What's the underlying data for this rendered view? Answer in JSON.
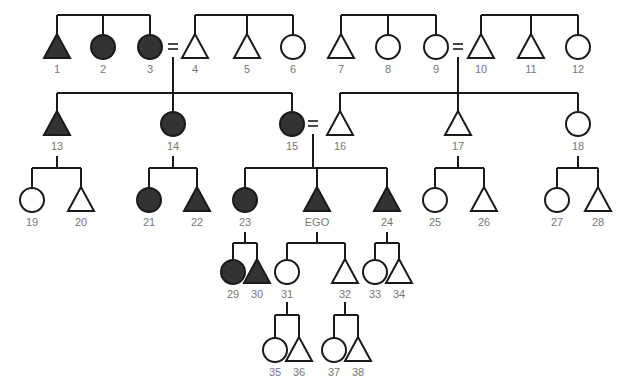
{
  "caption": "",
  "colors": {
    "line": "#1a1a1a",
    "affected_fill": "#333333",
    "unaffected_fill": "#ffffff",
    "label": "#777777"
  },
  "individuals": [
    {
      "id": "1",
      "label": "1",
      "sex": "male",
      "affected": true,
      "x": 57,
      "y": 47
    },
    {
      "id": "2",
      "label": "2",
      "sex": "female",
      "affected": true,
      "x": 103,
      "y": 47
    },
    {
      "id": "3",
      "label": "3",
      "sex": "female",
      "affected": true,
      "x": 150,
      "y": 47
    },
    {
      "id": "4",
      "label": "4",
      "sex": "male",
      "affected": false,
      "x": 195,
      "y": 47
    },
    {
      "id": "5",
      "label": "5",
      "sex": "male",
      "affected": false,
      "x": 247,
      "y": 47
    },
    {
      "id": "6",
      "label": "6",
      "sex": "female",
      "affected": false,
      "x": 293,
      "y": 47
    },
    {
      "id": "7",
      "label": "7",
      "sex": "male",
      "affected": false,
      "x": 341,
      "y": 47
    },
    {
      "id": "8",
      "label": "8",
      "sex": "female",
      "affected": false,
      "x": 388,
      "y": 47
    },
    {
      "id": "9",
      "label": "9",
      "sex": "female",
      "affected": false,
      "x": 436,
      "y": 47
    },
    {
      "id": "10",
      "label": "10",
      "sex": "male",
      "affected": false,
      "x": 481,
      "y": 47
    },
    {
      "id": "11",
      "label": "11",
      "sex": "male",
      "affected": false,
      "x": 531,
      "y": 47
    },
    {
      "id": "12",
      "label": "12",
      "sex": "female",
      "affected": false,
      "x": 578,
      "y": 47
    },
    {
      "id": "13",
      "label": "13",
      "sex": "male",
      "affected": true,
      "x": 57,
      "y": 124
    },
    {
      "id": "14",
      "label": "14",
      "sex": "female",
      "affected": true,
      "x": 173,
      "y": 124
    },
    {
      "id": "15",
      "label": "15",
      "sex": "female",
      "affected": true,
      "x": 292,
      "y": 124
    },
    {
      "id": "16",
      "label": "16",
      "sex": "male",
      "affected": false,
      "x": 340,
      "y": 124
    },
    {
      "id": "17",
      "label": "17",
      "sex": "male",
      "affected": false,
      "x": 458,
      "y": 124
    },
    {
      "id": "18",
      "label": "18",
      "sex": "female",
      "affected": false,
      "x": 578,
      "y": 124
    },
    {
      "id": "19",
      "label": "19",
      "sex": "female",
      "affected": false,
      "x": 32,
      "y": 200
    },
    {
      "id": "20",
      "label": "20",
      "sex": "male",
      "affected": false,
      "x": 81,
      "y": 200
    },
    {
      "id": "21",
      "label": "21",
      "sex": "female",
      "affected": true,
      "x": 149,
      "y": 200
    },
    {
      "id": "22",
      "label": "22",
      "sex": "male",
      "affected": true,
      "x": 197,
      "y": 200
    },
    {
      "id": "23",
      "label": "23",
      "sex": "female",
      "affected": true,
      "x": 245,
      "y": 200
    },
    {
      "id": "EGO",
      "label": "EGO",
      "sex": "male",
      "affected": true,
      "x": 317,
      "y": 200
    },
    {
      "id": "24",
      "label": "24",
      "sex": "male",
      "affected": true,
      "x": 387,
      "y": 200
    },
    {
      "id": "25",
      "label": "25",
      "sex": "female",
      "affected": false,
      "x": 435,
      "y": 200
    },
    {
      "id": "26",
      "label": "26",
      "sex": "male",
      "affected": false,
      "x": 484,
      "y": 200
    },
    {
      "id": "27",
      "label": "27",
      "sex": "female",
      "affected": false,
      "x": 557,
      "y": 200
    },
    {
      "id": "28",
      "label": "28",
      "sex": "male",
      "affected": false,
      "x": 598,
      "y": 200
    },
    {
      "id": "29",
      "label": "29",
      "sex": "female",
      "affected": true,
      "x": 233,
      "y": 272
    },
    {
      "id": "30",
      "label": "30",
      "sex": "male",
      "affected": true,
      "x": 257,
      "y": 272
    },
    {
      "id": "31",
      "label": "31",
      "sex": "female",
      "affected": false,
      "x": 287,
      "y": 272
    },
    {
      "id": "32",
      "label": "32",
      "sex": "male",
      "affected": false,
      "x": 345,
      "y": 272
    },
    {
      "id": "33",
      "label": "33",
      "sex": "female",
      "affected": false,
      "x": 375,
      "y": 272
    },
    {
      "id": "34",
      "label": "34",
      "sex": "male",
      "affected": false,
      "x": 399,
      "y": 272
    },
    {
      "id": "35",
      "label": "35",
      "sex": "female",
      "affected": false,
      "x": 275,
      "y": 350
    },
    {
      "id": "36",
      "label": "36",
      "sex": "male",
      "affected": false,
      "x": 299,
      "y": 350
    },
    {
      "id": "37",
      "label": "37",
      "sex": "female",
      "affected": false,
      "x": 334,
      "y": 350
    },
    {
      "id": "38",
      "label": "38",
      "sex": "male",
      "affected": false,
      "x": 358,
      "y": 350
    }
  ],
  "marriages": [
    {
      "between": [
        "3",
        "4"
      ],
      "x": 173,
      "y": 47
    },
    {
      "between": [
        "9",
        "10"
      ],
      "x": 458,
      "y": 47
    },
    {
      "between": [
        "15",
        "16"
      ],
      "x": 313,
      "y": 124
    }
  ]
}
